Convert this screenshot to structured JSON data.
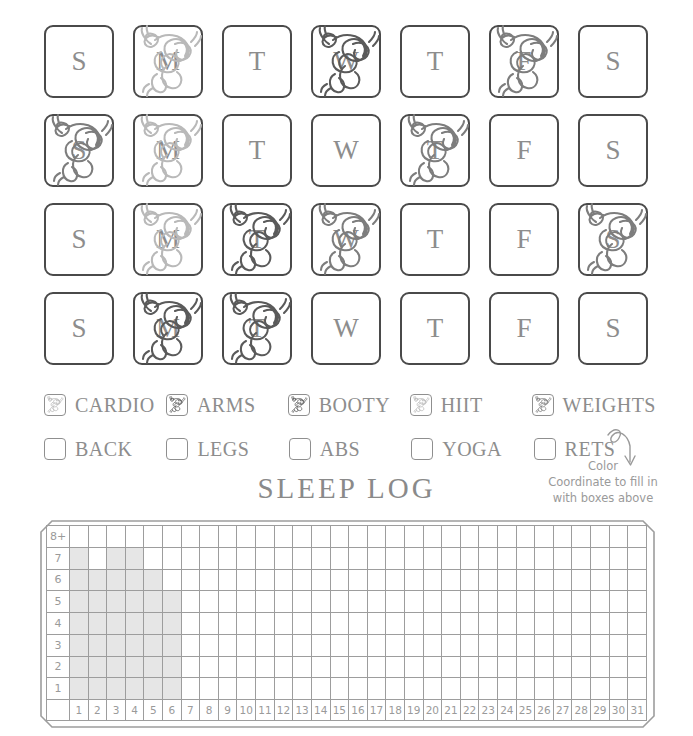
{
  "workout": {
    "rows": [
      {
        "cells": [
          {
            "letter": "S",
            "marked": false,
            "ink": "none"
          },
          {
            "letter": "M",
            "marked": true,
            "ink": "light"
          },
          {
            "letter": "T",
            "marked": false,
            "ink": "none"
          },
          {
            "letter": "W",
            "marked": true,
            "ink": "dark"
          },
          {
            "letter": "T",
            "marked": false,
            "ink": "none"
          },
          {
            "letter": "F",
            "marked": true,
            "ink": "medium"
          },
          {
            "letter": "S",
            "marked": false,
            "ink": "none"
          }
        ]
      },
      {
        "cells": [
          {
            "letter": "S",
            "marked": true,
            "ink": "medium"
          },
          {
            "letter": "M",
            "marked": true,
            "ink": "light"
          },
          {
            "letter": "T",
            "marked": false,
            "ink": "none"
          },
          {
            "letter": "W",
            "marked": false,
            "ink": "none"
          },
          {
            "letter": "T",
            "marked": true,
            "ink": "medium"
          },
          {
            "letter": "F",
            "marked": false,
            "ink": "none"
          },
          {
            "letter": "S",
            "marked": false,
            "ink": "none"
          }
        ]
      },
      {
        "cells": [
          {
            "letter": "S",
            "marked": false,
            "ink": "none"
          },
          {
            "letter": "M",
            "marked": true,
            "ink": "light"
          },
          {
            "letter": "T",
            "marked": true,
            "ink": "dark"
          },
          {
            "letter": "W",
            "marked": true,
            "ink": "medium"
          },
          {
            "letter": "T",
            "marked": false,
            "ink": "none"
          },
          {
            "letter": "F",
            "marked": false,
            "ink": "none"
          },
          {
            "letter": "S",
            "marked": true,
            "ink": "medium"
          }
        ]
      },
      {
        "cells": [
          {
            "letter": "S",
            "marked": false,
            "ink": "none"
          },
          {
            "letter": "M",
            "marked": true,
            "ink": "dark"
          },
          {
            "letter": "T",
            "marked": true,
            "ink": "dark"
          },
          {
            "letter": "W",
            "marked": false,
            "ink": "none"
          },
          {
            "letter": "T",
            "marked": false,
            "ink": "none"
          },
          {
            "letter": "F",
            "marked": false,
            "ink": "none"
          },
          {
            "letter": "S",
            "marked": false,
            "ink": "none"
          }
        ]
      }
    ]
  },
  "legend": {
    "row1": [
      {
        "label": "CARDIO",
        "filled": true,
        "ink": "light"
      },
      {
        "label": "ARMS",
        "filled": true,
        "ink": "dark"
      },
      {
        "label": "BOOTY",
        "filled": true,
        "ink": "dark"
      },
      {
        "label": "HIIT",
        "filled": true,
        "ink": "light"
      },
      {
        "label": "WEIGHTS",
        "filled": true,
        "ink": "medium"
      }
    ],
    "row2": [
      {
        "label": "BACK",
        "filled": false,
        "ink": "none"
      },
      {
        "label": "LEGS",
        "filled": false,
        "ink": "none"
      },
      {
        "label": "ABS",
        "filled": false,
        "ink": "none"
      },
      {
        "label": "YOGA",
        "filled": false,
        "ink": "none"
      },
      {
        "label": "RETS",
        "filled": false,
        "ink": "none"
      }
    ]
  },
  "annotation": {
    "line1": "Color",
    "line2": "Coordinate  to fill in",
    "line3": "with boxes above"
  },
  "sleep_log": {
    "title": "SLEEP LOG",
    "y_labels": [
      "8+",
      "7",
      "6",
      "5",
      "4",
      "3",
      "2",
      "1"
    ],
    "day_labels": [
      "1",
      "2",
      "3",
      "4",
      "5",
      "6",
      "7",
      "8",
      "9",
      "10",
      "11",
      "12",
      "13",
      "14",
      "15",
      "16",
      "17",
      "18",
      "19",
      "20",
      "21",
      "22",
      "23",
      "24",
      "25",
      "26",
      "27",
      "28",
      "29",
      "30",
      "31"
    ]
  },
  "chart_data": {
    "type": "bar",
    "title": "SLEEP LOG",
    "xlabel": "",
    "ylabel": "Hours of sleep",
    "categories": [
      "1",
      "2",
      "3",
      "4",
      "5",
      "6",
      "7",
      "8",
      "9",
      "10",
      "11",
      "12",
      "13",
      "14",
      "15",
      "16",
      "17",
      "18",
      "19",
      "20",
      "21",
      "22",
      "23",
      "24",
      "25",
      "26",
      "27",
      "28",
      "29",
      "30",
      "31"
    ],
    "values": [
      7,
      6,
      7,
      7,
      6,
      5,
      0,
      0,
      0,
      0,
      0,
      0,
      0,
      0,
      0,
      0,
      0,
      0,
      0,
      0,
      0,
      0,
      0,
      0,
      0,
      0,
      0,
      0,
      0,
      0,
      0
    ],
    "ytick_labels": [
      "1",
      "2",
      "3",
      "4",
      "5",
      "6",
      "7",
      "8+"
    ],
    "ylim": [
      0,
      8
    ],
    "grid": true,
    "legend": "none",
    "bar_color": "#e6e6e6"
  },
  "colors": {
    "ink_dark": "#5a5a5a",
    "ink_medium": "#7d7d7d",
    "ink_light": "#b9b9b9",
    "card_border": "#4a4a4a",
    "text": "#8d8d8d",
    "bar_fill": "#e6e6e6",
    "grid_line": "#9d9d9d"
  }
}
